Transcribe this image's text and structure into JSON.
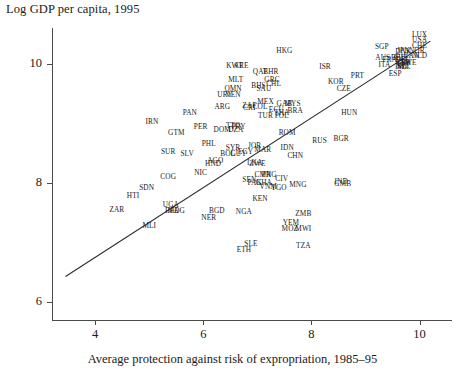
{
  "chart_data": {
    "type": "scatter",
    "title": "Log GDP per capita, 1995",
    "xlabel": "Average protection against risk of expropriation, 1985–95",
    "ylabel": "Log GDP per capita, 1995",
    "xlim": [
      3.2,
      10.6
    ],
    "ylim": [
      5.7,
      10.6
    ],
    "xticks": [
      4,
      6,
      8,
      10
    ],
    "yticks": [
      6,
      8,
      10
    ],
    "grid": false,
    "legend": null,
    "fit_line": {
      "x": [
        3.45,
        10.2
      ],
      "y": [
        6.43,
        10.38
      ]
    },
    "points": [
      {
        "label": "LUX",
        "x": 10.0,
        "y": 10.48
      },
      {
        "label": "USA",
        "x": 10.0,
        "y": 10.4
      },
      {
        "label": "CHE",
        "x": 10.0,
        "y": 10.3
      },
      {
        "label": "NOR",
        "x": 9.95,
        "y": 10.22
      },
      {
        "label": "HKG",
        "x": 7.5,
        "y": 10.22
      },
      {
        "label": "SGP",
        "x": 9.3,
        "y": 10.28
      },
      {
        "label": "JPN",
        "x": 9.7,
        "y": 10.22
      },
      {
        "label": "DNK",
        "x": 9.7,
        "y": 10.2
      },
      {
        "label": "NLD",
        "x": 10.0,
        "y": 10.13
      },
      {
        "label": "CAN",
        "x": 9.85,
        "y": 10.13
      },
      {
        "label": "AUS",
        "x": 9.32,
        "y": 10.1
      },
      {
        "label": "AUT",
        "x": 9.65,
        "y": 10.1
      },
      {
        "label": "BEL",
        "x": 9.6,
        "y": 10.1
      },
      {
        "label": "FRA",
        "x": 9.45,
        "y": 10.07
      },
      {
        "label": "DEU",
        "x": 9.7,
        "y": 10.07
      },
      {
        "label": "GBR",
        "x": 9.7,
        "y": 10.02
      },
      {
        "label": "SWE",
        "x": 9.8,
        "y": 10.02
      },
      {
        "label": "FIN",
        "x": 9.7,
        "y": 9.99
      },
      {
        "label": "ITA",
        "x": 9.35,
        "y": 9.98
      },
      {
        "label": "IRL",
        "x": 9.7,
        "y": 9.97
      },
      {
        "label": "NZL",
        "x": 9.7,
        "y": 9.95
      },
      {
        "label": "ISL",
        "x": 9.65,
        "y": 9.94
      },
      {
        "label": "ESP",
        "x": 9.55,
        "y": 9.82
      },
      {
        "label": "ISR",
        "x": 8.25,
        "y": 9.95
      },
      {
        "label": "KWT",
        "x": 6.58,
        "y": 9.97
      },
      {
        "label": "ARE",
        "x": 6.7,
        "y": 9.97
      },
      {
        "label": "QAT",
        "x": 7.05,
        "y": 9.86
      },
      {
        "label": "BHR",
        "x": 7.25,
        "y": 9.86
      },
      {
        "label": "PRT",
        "x": 8.85,
        "y": 9.8
      },
      {
        "label": "KOR",
        "x": 8.45,
        "y": 9.7
      },
      {
        "label": "MLT",
        "x": 6.6,
        "y": 9.72
      },
      {
        "label": "GRC",
        "x": 7.27,
        "y": 9.72
      },
      {
        "label": "CHL",
        "x": 7.3,
        "y": 9.66
      },
      {
        "label": "CZE",
        "x": 8.6,
        "y": 9.57
      },
      {
        "label": "BHS",
        "x": 7.02,
        "y": 9.62
      },
      {
        "label": "SAU",
        "x": 7.12,
        "y": 9.58
      },
      {
        "label": "OMN",
        "x": 6.55,
        "y": 9.58
      },
      {
        "label": "URY",
        "x": 6.4,
        "y": 9.47
      },
      {
        "label": "VEN",
        "x": 6.55,
        "y": 9.47
      },
      {
        "label": "ARG",
        "x": 6.35,
        "y": 9.28
      },
      {
        "label": "MEX",
        "x": 7.15,
        "y": 9.36
      },
      {
        "label": "GAB",
        "x": 7.5,
        "y": 9.33
      },
      {
        "label": "MYS",
        "x": 7.65,
        "y": 9.33
      },
      {
        "label": "ZAF",
        "x": 6.85,
        "y": 9.29
      },
      {
        "label": "COL",
        "x": 7.05,
        "y": 9.28
      },
      {
        "label": "CRI",
        "x": 6.85,
        "y": 9.26
      },
      {
        "label": "PAN",
        "x": 5.75,
        "y": 9.18
      },
      {
        "label": "HUN",
        "x": 8.7,
        "y": 9.18
      },
      {
        "label": "BRA",
        "x": 7.7,
        "y": 9.2
      },
      {
        "label": "ECU",
        "x": 7.35,
        "y": 9.22
      },
      {
        "label": "THA",
        "x": 7.45,
        "y": 9.18
      },
      {
        "label": "TUR",
        "x": 7.15,
        "y": 9.12
      },
      {
        "label": "POL",
        "x": 7.45,
        "y": 9.12
      },
      {
        "label": "IRN",
        "x": 5.05,
        "y": 9.02
      },
      {
        "label": "TTO",
        "x": 6.55,
        "y": 8.96
      },
      {
        "label": "PRY",
        "x": 6.65,
        "y": 8.94
      },
      {
        "label": "DZA",
        "x": 6.6,
        "y": 8.89
      },
      {
        "label": "DOM",
        "x": 6.35,
        "y": 8.89
      },
      {
        "label": "PER",
        "x": 5.95,
        "y": 8.94
      },
      {
        "label": "ROM",
        "x": 7.55,
        "y": 8.84
      },
      {
        "label": "RUS",
        "x": 8.15,
        "y": 8.71
      },
      {
        "label": "BGR",
        "x": 8.55,
        "y": 8.73
      },
      {
        "label": "GTM",
        "x": 5.5,
        "y": 8.84
      },
      {
        "label": "JOR",
        "x": 6.95,
        "y": 8.62
      },
      {
        "label": "PHL",
        "x": 6.1,
        "y": 8.65
      },
      {
        "label": "SYR",
        "x": 6.55,
        "y": 8.58
      },
      {
        "label": "SUR",
        "x": 5.35,
        "y": 8.52
      },
      {
        "label": "SLV",
        "x": 5.7,
        "y": 8.48
      },
      {
        "label": "BOL",
        "x": 6.45,
        "y": 8.48
      },
      {
        "label": "GUY",
        "x": 6.65,
        "y": 8.48
      },
      {
        "label": "MAR",
        "x": 7.1,
        "y": 8.56
      },
      {
        "label": "EGY",
        "x": 6.78,
        "y": 8.52
      },
      {
        "label": "IDN",
        "x": 7.55,
        "y": 8.58
      },
      {
        "label": "AGO",
        "x": 6.22,
        "y": 8.36
      },
      {
        "label": "HND",
        "x": 6.18,
        "y": 8.31
      },
      {
        "label": "CHN",
        "x": 7.7,
        "y": 8.45
      },
      {
        "label": "LKA",
        "x": 6.95,
        "y": 8.33
      },
      {
        "label": "ZWE",
        "x": 7.0,
        "y": 8.31
      },
      {
        "label": "NIC",
        "x": 5.95,
        "y": 8.17
      },
      {
        "label": "COG",
        "x": 5.35,
        "y": 8.1
      },
      {
        "label": "CMR",
        "x": 7.1,
        "y": 8.13
      },
      {
        "label": "PNG",
        "x": 7.22,
        "y": 8.13
      },
      {
        "label": "CIV",
        "x": 7.45,
        "y": 8.06
      },
      {
        "label": "SEN",
        "x": 6.85,
        "y": 8.05
      },
      {
        "label": "PAK",
        "x": 6.95,
        "y": 8.0
      },
      {
        "label": "GHA",
        "x": 7.12,
        "y": 8.0
      },
      {
        "label": "IND",
        "x": 8.55,
        "y": 8.02
      },
      {
        "label": "GMB",
        "x": 8.58,
        "y": 7.98
      },
      {
        "label": "VNM",
        "x": 7.2,
        "y": 7.94
      },
      {
        "label": "TGO",
        "x": 7.4,
        "y": 7.92
      },
      {
        "label": "MNG",
        "x": 7.75,
        "y": 7.96
      },
      {
        "label": "SDN",
        "x": 4.95,
        "y": 7.92
      },
      {
        "label": "HTI",
        "x": 4.7,
        "y": 7.78
      },
      {
        "label": "KEN",
        "x": 7.05,
        "y": 7.73
      },
      {
        "label": "ZAR",
        "x": 4.4,
        "y": 7.55
      },
      {
        "label": "UGA",
        "x": 5.4,
        "y": 7.63
      },
      {
        "label": "BFA",
        "x": 5.42,
        "y": 7.53
      },
      {
        "label": "MDG",
        "x": 5.5,
        "y": 7.53
      },
      {
        "label": "BGD",
        "x": 6.25,
        "y": 7.53
      },
      {
        "label": "NGA",
        "x": 6.75,
        "y": 7.52
      },
      {
        "label": "NER",
        "x": 6.1,
        "y": 7.42
      },
      {
        "label": "ZMB",
        "x": 7.85,
        "y": 7.48
      },
      {
        "label": "YEM",
        "x": 7.62,
        "y": 7.33
      },
      {
        "label": "MLI",
        "x": 5.0,
        "y": 7.28
      },
      {
        "label": "MOZ",
        "x": 7.6,
        "y": 7.22
      },
      {
        "label": "MWI",
        "x": 7.85,
        "y": 7.22
      },
      {
        "label": "SLE",
        "x": 6.88,
        "y": 6.98
      },
      {
        "label": "TZA",
        "x": 7.85,
        "y": 6.95
      },
      {
        "label": "ETH",
        "x": 6.75,
        "y": 6.88
      }
    ]
  }
}
